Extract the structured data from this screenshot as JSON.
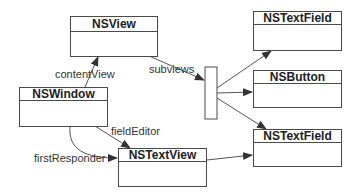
{
  "diagram": {
    "nodes": {
      "nsview": {
        "title": "NSView"
      },
      "nswindow": {
        "title": "NSWindow"
      },
      "nstextview": {
        "title": "NSTextView"
      },
      "nstextfield_top": {
        "title": "NSTextField"
      },
      "nsbutton": {
        "title": "NSButton"
      },
      "nstextfield_bottom": {
        "title": "NSTextField"
      }
    },
    "edges": {
      "content_view": "contentView",
      "subviews": "subviews",
      "field_editor": "fieldEditor",
      "first_responder": "firstResponder"
    },
    "colors": {
      "stroke": "#4a4a4a",
      "text": "#222222"
    }
  }
}
